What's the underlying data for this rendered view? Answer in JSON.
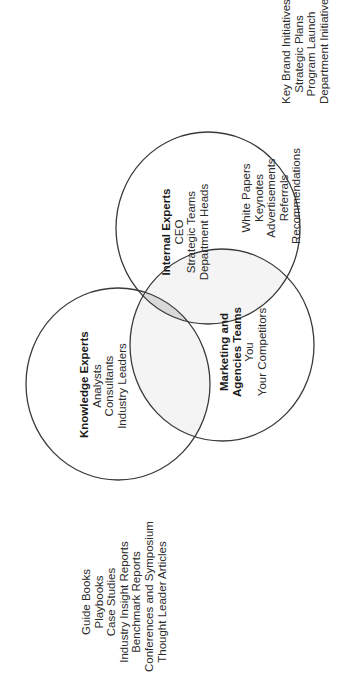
{
  "diagram": {
    "type": "venn",
    "orientation": "rotated-90-ccw",
    "circles": [
      {
        "id": "internal-experts",
        "title": "Internal Experts",
        "members": [
          "CEO",
          "Strategic Teams",
          "Department Heads"
        ],
        "outside_items": [
          "Key Brand Initiatives",
          "Strategic Plans",
          "Program Launch",
          "Department Initiatives"
        ]
      },
      {
        "id": "knowledge-experts",
        "title": "Knowledge Experts",
        "members": [
          "Analysts",
          "Consultants",
          "Industry Leaders"
        ],
        "outside_items": [
          "Guide Books",
          "Playbooks",
          "Case Studies",
          "Industry Insight Reports",
          "Benchmark Reports",
          "Conferences and Symposium",
          "Thought Leader Articles"
        ]
      },
      {
        "id": "marketing-agencies",
        "title_lines": [
          "Marketing and",
          "Agencies Teams"
        ],
        "members": [
          "You",
          "Your Competitors"
        ],
        "outside_items": [
          "White Papers",
          "Keynotes",
          "Advertisements",
          "Referrals",
          "Recommendations"
        ]
      }
    ],
    "colors": {
      "stroke": "#3a3a3a",
      "pair_overlap_fill": "#f4f4f4",
      "center_overlap_fill": "#d9d9d9",
      "text": "#2b2b2b"
    }
  }
}
